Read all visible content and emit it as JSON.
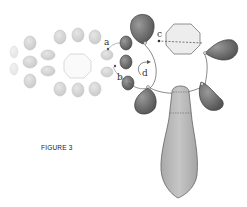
{
  "figure": {
    "caption": "FIGURE 3",
    "labels": {
      "a": "a",
      "b": "b",
      "c": "c",
      "d": "d"
    }
  },
  "colors": {
    "faded_fill": "#d9d9d9",
    "faded_stroke": "#c4c4c4",
    "dark_fill": "#6e6e6e",
    "dark_stroke": "#3a3a3a",
    "mid_fill": "#b8b8b8",
    "octagon_fill": "#ececec",
    "line": "#555555"
  }
}
